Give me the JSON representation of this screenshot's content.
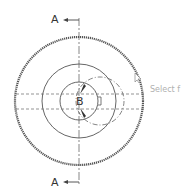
{
  "drawing": {
    "section_label_top": "A",
    "section_label_bottom": "A",
    "detail_label": "B",
    "cursor_hint": "Select f"
  },
  "colors": {
    "line": "#444444",
    "hint": "#b0b0b0"
  }
}
